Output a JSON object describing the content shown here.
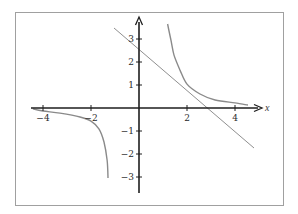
{
  "chart_data": {
    "type": "line",
    "title": "",
    "xlabel": "x",
    "ylabel": "",
    "xlim": [
      -4.4,
      5.0
    ],
    "ylim": [
      -3.8,
      3.9
    ],
    "grid": false,
    "legend": null,
    "x_ticks": [
      -4,
      -2,
      2,
      4
    ],
    "x_tick_labels": [
      "−4",
      "−2",
      "2",
      "4"
    ],
    "y_ticks": [
      3,
      2,
      1,
      -1,
      -2,
      -3
    ],
    "y_tick_labels": [
      "3",
      "2",
      "1",
      "−1",
      "−2",
      "−3"
    ],
    "series": [
      {
        "name": "curve-right-branch",
        "style": "curve",
        "color": "#8a8a8a",
        "points": [
          [
            1.19,
            3.65
          ],
          [
            1.33,
            2.96
          ],
          [
            1.46,
            2.3
          ],
          [
            1.71,
            1.65
          ],
          [
            2.0,
            1.04
          ],
          [
            2.54,
            0.61
          ],
          [
            3.17,
            0.35
          ],
          [
            4.0,
            0.22
          ],
          [
            4.54,
            0.13
          ]
        ]
      },
      {
        "name": "curve-left-branch",
        "style": "curve",
        "color": "#8a8a8a",
        "points": [
          [
            -4.42,
            -0.04
          ],
          [
            -4.0,
            -0.13
          ],
          [
            -3.29,
            -0.22
          ],
          [
            -2.46,
            -0.39
          ],
          [
            -2.0,
            -0.57
          ],
          [
            -1.67,
            -0.91
          ],
          [
            -1.46,
            -1.48
          ],
          [
            -1.33,
            -2.26
          ],
          [
            -1.29,
            -3.04
          ]
        ]
      },
      {
        "name": "tangent-line",
        "style": "line",
        "color": "#8a8a8a",
        "points": [
          [
            -1.04,
            3.48
          ],
          [
            4.79,
            -1.74
          ]
        ],
        "slope": -0.9,
        "y_intercept": 2.54
      }
    ]
  },
  "axes": {
    "x_label": "x",
    "x_ticks": [
      {
        "value": -4,
        "label": "−4"
      },
      {
        "value": -2,
        "label": "−2"
      },
      {
        "value": 2,
        "label": "2"
      },
      {
        "value": 4,
        "label": "4"
      }
    ],
    "y_ticks": [
      {
        "value": 3,
        "label": "3"
      },
      {
        "value": 2,
        "label": "2"
      },
      {
        "value": 1,
        "label": "1"
      },
      {
        "value": -1,
        "label": "−1"
      },
      {
        "value": -2,
        "label": "−2"
      },
      {
        "value": -3,
        "label": "−3"
      }
    ]
  },
  "colors": {
    "axis": "#1e1e1e",
    "curve": "#8c8c8c",
    "frame": "#9a9a9a",
    "text": "#2a2a2a"
  }
}
